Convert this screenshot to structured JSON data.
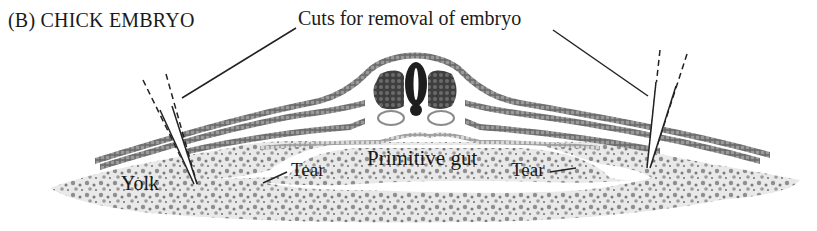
{
  "figure": {
    "panel_label": "(B)  CHICK EMBRYO",
    "labels": {
      "cuts": "Cuts for removal of embryo",
      "primitive_gut": "Primitive gut",
      "tear_left": "Tear",
      "tear_right": "Tear",
      "yolk": "Yolk"
    },
    "colors": {
      "ectoderm": "#555555",
      "mesoderm": "#4a4a4a",
      "endoderm": "#8a8a8a",
      "neural_tube": "#1e1e1e",
      "somite": "#555555",
      "yolk": "#9a9a9a",
      "line": "#222222"
    }
  }
}
